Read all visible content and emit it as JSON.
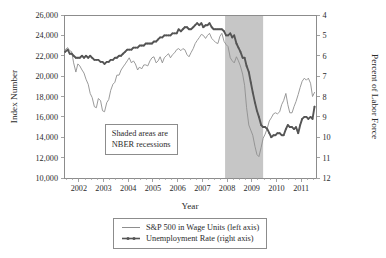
{
  "chart_data": {
    "type": "line",
    "title": "",
    "xlabel": "Year",
    "ylabel": "Index Number",
    "y2label": "Percent of Labor Force",
    "xlim": [
      2001.4,
      2011.6
    ],
    "ylim": [
      10000,
      26000
    ],
    "y2lim": [
      12,
      4
    ],
    "y2_inverted": true,
    "grid": false,
    "legend_position": "below-axes",
    "x_ticks": [
      "2002",
      "2003",
      "2004",
      "2005",
      "2006",
      "2007",
      "2008",
      "2009",
      "2010",
      "2011"
    ],
    "x_tick_values": [
      2002,
      2003,
      2004,
      2005,
      2006,
      2007,
      2008,
      2009,
      2010,
      2011
    ],
    "x_minor_ticks_per_year": 4,
    "y_ticks": [
      "10,000",
      "12,000",
      "14,000",
      "16,000",
      "18,000",
      "20,000",
      "22,000",
      "24,000",
      "26,000"
    ],
    "y_tick_values": [
      10000,
      12000,
      14000,
      16000,
      18000,
      20000,
      22000,
      24000,
      26000
    ],
    "y2_ticks": [
      "4",
      "5",
      "6",
      "7",
      "8",
      "9",
      "10",
      "11",
      "12"
    ],
    "y2_tick_values": [
      4,
      5,
      6,
      7,
      8,
      9,
      10,
      11,
      12
    ],
    "annotations": [
      {
        "name": "nber-note",
        "line1": "Shaded areas are",
        "line2": "NBER recessions"
      }
    ],
    "shaded_regions": [
      {
        "label": "NBER recession",
        "x_start": 2007.92,
        "x_end": 2009.46,
        "color": "#c6c6c6"
      }
    ],
    "series": [
      {
        "name": "S&P 500 in Wage Units (left axis)",
        "axis": "left",
        "color": "#8e8e8e",
        "marker": "none",
        "x": [
          2001.45,
          2001.55,
          2001.63,
          2001.71,
          2001.79,
          2001.88,
          2001.96,
          2002.04,
          2002.13,
          2002.21,
          2002.29,
          2002.38,
          2002.46,
          2002.54,
          2002.63,
          2002.71,
          2002.79,
          2002.88,
          2002.96,
          2003.04,
          2003.13,
          2003.21,
          2003.29,
          2003.38,
          2003.46,
          2003.54,
          2003.63,
          2003.71,
          2003.79,
          2003.88,
          2003.96,
          2004.04,
          2004.13,
          2004.21,
          2004.29,
          2004.38,
          2004.46,
          2004.54,
          2004.63,
          2004.71,
          2004.79,
          2004.88,
          2004.96,
          2005.04,
          2005.13,
          2005.21,
          2005.29,
          2005.38,
          2005.46,
          2005.54,
          2005.63,
          2005.71,
          2005.79,
          2005.88,
          2005.96,
          2006.04,
          2006.13,
          2006.21,
          2006.29,
          2006.38,
          2006.46,
          2006.54,
          2006.63,
          2006.71,
          2006.79,
          2006.88,
          2006.96,
          2007.04,
          2007.13,
          2007.21,
          2007.29,
          2007.38,
          2007.46,
          2007.54,
          2007.63,
          2007.71,
          2007.79,
          2007.88,
          2007.96,
          2008.04,
          2008.13,
          2008.21,
          2008.29,
          2008.38,
          2008.46,
          2008.54,
          2008.63,
          2008.71,
          2008.79,
          2008.88,
          2008.96,
          2009.04,
          2009.13,
          2009.21,
          2009.29,
          2009.38,
          2009.46,
          2009.54,
          2009.63,
          2009.71,
          2009.79,
          2009.88,
          2009.96,
          2010.04,
          2010.13,
          2010.21,
          2010.29,
          2010.38,
          2010.46,
          2010.54,
          2010.63,
          2010.71,
          2010.79,
          2010.88,
          2010.96,
          2011.04,
          2011.13,
          2011.21,
          2011.29,
          2011.38,
          2011.46,
          2011.54
        ],
        "y": [
          22600,
          22800,
          22500,
          22400,
          21300,
          20400,
          21200,
          21000,
          20600,
          20300,
          19700,
          19200,
          18300,
          17900,
          17000,
          16900,
          17800,
          17600,
          16600,
          16500,
          17400,
          17700,
          18600,
          19200,
          19400,
          20100,
          20100,
          20600,
          20900,
          21200,
          21500,
          21800,
          21300,
          21500,
          21200,
          20600,
          20900,
          20700,
          21100,
          21100,
          21000,
          21500,
          21800,
          21900,
          21300,
          21500,
          21900,
          21300,
          21800,
          22000,
          22200,
          21800,
          22100,
          22300,
          22600,
          22700,
          22500,
          22700,
          22600,
          22100,
          21900,
          22300,
          22700,
          23200,
          23500,
          23800,
          24100,
          24000,
          23700,
          24000,
          24200,
          23700,
          23500,
          23300,
          23200,
          23900,
          24200,
          23400,
          23100,
          22900,
          21800,
          21500,
          21300,
          21900,
          21500,
          21000,
          20200,
          19100,
          16900,
          15200,
          14700,
          14200,
          13100,
          12300,
          12100,
          13000,
          13900,
          14300,
          14900,
          15600,
          15900,
          16300,
          16400,
          16300,
          16500,
          17200,
          17600,
          18300,
          17200,
          16400,
          16400,
          17000,
          17500,
          18200,
          18900,
          19500,
          19800,
          19600,
          19800,
          19300,
          18000,
          18400
        ]
      },
      {
        "name": "Unemployment Rate (right axis)",
        "axis": "right",
        "color": "#555555",
        "marker": "small-dot",
        "x": [
          2001.45,
          2001.55,
          2001.63,
          2001.71,
          2001.79,
          2001.88,
          2001.96,
          2002.04,
          2002.13,
          2002.21,
          2002.29,
          2002.38,
          2002.46,
          2002.54,
          2002.63,
          2002.71,
          2002.79,
          2002.88,
          2002.96,
          2003.04,
          2003.13,
          2003.21,
          2003.29,
          2003.38,
          2003.46,
          2003.54,
          2003.63,
          2003.71,
          2003.79,
          2003.88,
          2003.96,
          2004.04,
          2004.13,
          2004.21,
          2004.29,
          2004.38,
          2004.46,
          2004.54,
          2004.63,
          2004.71,
          2004.79,
          2004.88,
          2004.96,
          2005.04,
          2005.13,
          2005.21,
          2005.29,
          2005.38,
          2005.46,
          2005.54,
          2005.63,
          2005.71,
          2005.79,
          2005.88,
          2005.96,
          2006.04,
          2006.13,
          2006.21,
          2006.29,
          2006.38,
          2006.46,
          2006.54,
          2006.63,
          2006.71,
          2006.79,
          2006.88,
          2006.96,
          2007.04,
          2007.13,
          2007.21,
          2007.29,
          2007.38,
          2007.46,
          2007.54,
          2007.63,
          2007.71,
          2007.79,
          2007.88,
          2007.96,
          2008.04,
          2008.13,
          2008.21,
          2008.29,
          2008.38,
          2008.46,
          2008.54,
          2008.63,
          2008.71,
          2008.79,
          2008.88,
          2008.96,
          2009.04,
          2009.13,
          2009.21,
          2009.29,
          2009.38,
          2009.46,
          2009.54,
          2009.63,
          2009.71,
          2009.79,
          2009.88,
          2009.96,
          2010.04,
          2010.13,
          2010.21,
          2010.29,
          2010.38,
          2010.46,
          2010.54,
          2010.63,
          2010.71,
          2010.79,
          2010.88,
          2010.96,
          2011.04,
          2011.13,
          2011.21,
          2011.29,
          2011.38,
          2011.46,
          2011.54
        ],
        "y": [
          5.8,
          5.7,
          5.9,
          5.9,
          6.0,
          6.1,
          6.1,
          6.1,
          6.0,
          6.1,
          6.0,
          6.1,
          6.0,
          6.1,
          6.2,
          6.2,
          6.2,
          6.3,
          6.3,
          6.4,
          6.3,
          6.3,
          6.2,
          6.2,
          6.1,
          6.1,
          6.0,
          6.0,
          5.9,
          5.8,
          5.7,
          5.7,
          5.7,
          5.6,
          5.6,
          5.6,
          5.5,
          5.5,
          5.5,
          5.4,
          5.4,
          5.4,
          5.4,
          5.3,
          5.3,
          5.2,
          5.1,
          5.1,
          5.0,
          5.0,
          5.0,
          5.0,
          4.9,
          4.9,
          4.9,
          4.7,
          4.8,
          4.7,
          4.6,
          4.6,
          4.7,
          4.7,
          4.6,
          4.5,
          4.4,
          4.5,
          4.4,
          4.6,
          4.5,
          4.5,
          4.4,
          4.6,
          4.7,
          4.7,
          4.7,
          4.7,
          4.7,
          4.8,
          5.0,
          5.0,
          4.9,
          5.1,
          5.0,
          5.4,
          5.6,
          5.8,
          6.1,
          6.1,
          6.5,
          6.8,
          7.3,
          7.8,
          8.3,
          8.7,
          9.0,
          9.4,
          9.5,
          9.5,
          9.6,
          9.8,
          10.0,
          9.9,
          9.9,
          9.8,
          9.8,
          9.9,
          9.9,
          9.6,
          9.4,
          9.5,
          9.5,
          9.6,
          9.5,
          9.8,
          9.4,
          9.1,
          9.0,
          9.0,
          9.1,
          9.0,
          9.1,
          8.5
        ]
      }
    ]
  },
  "legend": {
    "items": [
      {
        "label": "S&P 500 in Wage Units (left axis)",
        "style": "thin-line",
        "color": "#8e8e8e"
      },
      {
        "label": "Unemployment Rate (right axis)",
        "style": "thick-line-with-markers",
        "color": "#555555"
      }
    ]
  },
  "colors": {
    "axis": "#8c8c8c",
    "text": "#2b2b2b",
    "recession_shade": "#c6c6c6",
    "sp500_line": "#8e8e8e",
    "unemployment_line": "#555555",
    "background": "#ffffff"
  }
}
